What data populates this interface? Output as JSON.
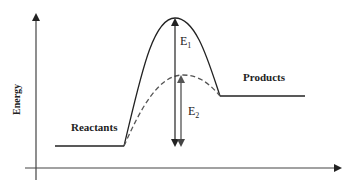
{
  "diagram": {
    "type": "reaction energy profile",
    "y_axis_label": "Energy",
    "x_axis_label": "",
    "reactants_label": "Reactants",
    "products_label": "Products",
    "e1": {
      "base": "E",
      "sub": "1",
      "description": "activation energy uncatalyzed (solid curve)"
    },
    "e2": {
      "base": "E",
      "sub": "2",
      "description": "activation energy catalyzed (dashed curve)"
    },
    "curves": [
      {
        "name": "uncatalyzed",
        "style": "solid"
      },
      {
        "name": "catalyzed",
        "style": "dashed"
      }
    ],
    "colors": {
      "line": "#333333",
      "dashed": "#555555",
      "background": "#ffffff"
    }
  }
}
